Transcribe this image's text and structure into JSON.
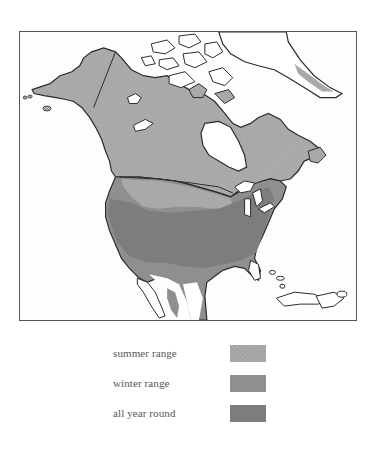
{
  "map": {
    "subject": "North America range map",
    "colors": {
      "land_outside_range": "#ffffff",
      "summer_range": "#a9a9a9",
      "winter_range": "#8f8f8f",
      "all_year_round": "#7d7d7d",
      "outline": "#2b2b2b",
      "frame": "#555555"
    }
  },
  "legend": {
    "items": [
      {
        "label": "summer range",
        "color": "#a9a9a9",
        "pattern": "fine-hatch"
      },
      {
        "label": "winter range",
        "color": "#8f8f8f",
        "pattern": "solid"
      },
      {
        "label": "all year round",
        "color": "#7d7d7d",
        "pattern": "solid"
      }
    ]
  }
}
